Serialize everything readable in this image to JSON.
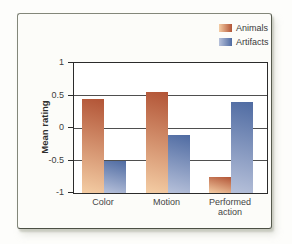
{
  "colors": {
    "panel_background": "#fcfcf9",
    "panel_border": "#83877a",
    "plot_border": "#2b2b2b",
    "gridline": "#4f4f4f",
    "text": "#3d3d3d",
    "animals_dark": "#b25436",
    "animals_light": "#f4cda4",
    "artifacts_dark": "#4f6ba2",
    "artifacts_light": "#b7c1da"
  },
  "chart_data": {
    "type": "bar",
    "title": "",
    "categories": [
      "Color",
      "Motion",
      "Performed action"
    ],
    "series": [
      {
        "name": "Animals",
        "values": [
          0.45,
          0.55,
          -0.75
        ],
        "color_dark": "#b25436",
        "color_light": "#f4cda4"
      },
      {
        "name": "Artifacts",
        "values": [
          -0.5,
          -0.1,
          0.4
        ],
        "color_dark": "#4f6ba2",
        "color_light": "#b7c1da"
      }
    ],
    "xlabel": "",
    "ylabel": "Mean rating",
    "ylim": [
      -1,
      1
    ],
    "yticks": [
      {
        "value": 1,
        "label": "1"
      },
      {
        "value": 0.5,
        "label": "0.5"
      },
      {
        "value": 0,
        "label": "0"
      },
      {
        "value": -0.5,
        "label": "-0.5"
      },
      {
        "value": -1,
        "label": "-1"
      }
    ],
    "bar_baseline": -1,
    "grid": true,
    "legend_position": "top-right"
  }
}
